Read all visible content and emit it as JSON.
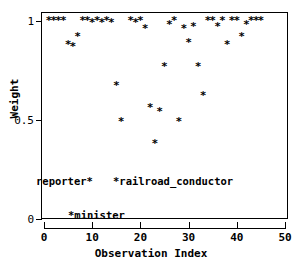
{
  "chart_data": {
    "type": "scatter",
    "title": "",
    "xlabel": "Observation Index",
    "ylabel": "Weight",
    "xlim": [
      0,
      50
    ],
    "ylim": [
      0,
      1
    ],
    "grid": false,
    "legend": "none",
    "marker": "*",
    "marker_color": "#000000",
    "xticks": [
      0,
      10,
      20,
      30,
      40,
      50
    ],
    "xticklabels": [
      "0",
      "10",
      "20",
      "30",
      "40",
      "50"
    ],
    "yticks": [
      0,
      0.5,
      1
    ],
    "yticklabels": [
      "0",
      "0.5",
      "1"
    ],
    "x": [
      1,
      2,
      3,
      4,
      5,
      6,
      7,
      8,
      9,
      10,
      11,
      12,
      13,
      14,
      15,
      16,
      18,
      19,
      20,
      21,
      22,
      23,
      24,
      25,
      26,
      27,
      28,
      29,
      30,
      31,
      32,
      33,
      34,
      35,
      36,
      37,
      38,
      39,
      40,
      41,
      42,
      43,
      44,
      45
    ],
    "y": [
      1.0,
      1.0,
      1.0,
      1.0,
      0.88,
      0.87,
      0.92,
      1.0,
      1.0,
      0.99,
      1.0,
      0.99,
      1.0,
      0.99,
      0.67,
      0.49,
      1.0,
      0.99,
      1.0,
      0.96,
      0.56,
      0.38,
      0.54,
      0.77,
      0.98,
      1.0,
      0.49,
      0.96,
      0.89,
      0.97,
      0.77,
      0.62,
      1.0,
      1.0,
      0.97,
      1.0,
      0.88,
      1.0,
      1.0,
      0.92,
      0.98,
      1.0,
      1.0,
      1.0
    ],
    "annotations": [
      {
        "text": "reporter*",
        "x_px": 36,
        "y_px": 176,
        "name": "annotation-reporter"
      },
      {
        "text": "*railroad_conductor",
        "x_px": 113,
        "y_px": 176,
        "name": "annotation-railroad-conductor"
      },
      {
        "text": "*minister",
        "x_px": 68,
        "y_px": 210,
        "name": "annotation-minister"
      }
    ]
  },
  "axes": {
    "x_title": "Observation Index",
    "y_title": "Weight",
    "x_ticklabels": [
      "0",
      "10",
      "20",
      "30",
      "40",
      "50"
    ],
    "y_ticklabels": [
      "1",
      "0.5",
      "0"
    ]
  }
}
